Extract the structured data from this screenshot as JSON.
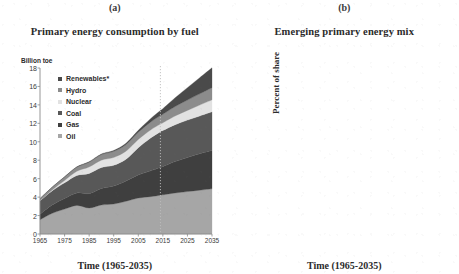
{
  "figure": {
    "panels": [
      {
        "letter": "(a)",
        "title": "Primary energy consumption by fuel",
        "y_unit": "Billion toe",
        "xlabel": "Time (1965-2035)"
      },
      {
        "letter": "(b)",
        "title": "Emerging primary energy mix",
        "ylabel": "Percent of share",
        "xlabel": "Time (1965-2035)"
      }
    ]
  },
  "colors": {
    "oil": "#a6a6a6",
    "gas": "#3f3f3f",
    "coal": "#585858",
    "nuclear": "#e2e2e2",
    "hydro": "#8c8c8c",
    "renewables": "#4a4a4a",
    "axis": "#8a8a8a",
    "forecast_line": "#bdbdbd",
    "line_oil": "#a8a8a8",
    "line_coal": "#5d5d5d",
    "line_gas": "#2f2f2f",
    "line_hydro": "#6e6e6e",
    "line_nuclear": "#b5b5b5",
    "line_renewables": "#4a4a4a"
  },
  "chart_data": [
    {
      "type": "area",
      "id": "primary-energy-consumption-by-fuel",
      "title": "Primary energy consumption by fuel",
      "panel": "(a)",
      "xlabel": "Time (1965-2035)",
      "ylabel": "Billion toe",
      "ylim": [
        0,
        18
      ],
      "xlim": [
        1965,
        2035
      ],
      "yticks": [
        "0",
        "2",
        "4",
        "6",
        "8",
        "10",
        "12",
        "14",
        "16",
        "18"
      ],
      "ytick_values": [
        0,
        2,
        4,
        6,
        8,
        10,
        12,
        14,
        16,
        18
      ],
      "xticks": [
        "1965",
        "1975",
        "1985",
        "1995",
        "2005",
        "2015",
        "2025",
        "2035"
      ],
      "xtick_values": [
        1965,
        1975,
        1985,
        1995,
        2005,
        2015,
        2025,
        2035
      ],
      "stacked": true,
      "grid": false,
      "legend_position": "inside-top-left",
      "annotations": [
        {
          "type": "vline",
          "x": 2014,
          "style": "dotted",
          "label": "forecast start"
        }
      ],
      "x": [
        1965,
        1970,
        1975,
        1980,
        1985,
        1990,
        1995,
        2000,
        2005,
        2010,
        2014,
        2015,
        2020,
        2025,
        2030,
        2035
      ],
      "series": [
        {
          "name": "Oil",
          "color": "#a6a6a6",
          "values": [
            1.55,
            2.25,
            2.7,
            3.1,
            2.82,
            3.15,
            3.25,
            3.55,
            3.9,
            4.05,
            4.2,
            4.25,
            4.45,
            4.6,
            4.75,
            4.9
          ]
        },
        {
          "name": "Gas",
          "color": "#3f3f3f",
          "values": [
            0.6,
            0.9,
            1.15,
            1.35,
            1.55,
            1.78,
            1.95,
            2.2,
            2.5,
            2.8,
            3.0,
            3.05,
            3.4,
            3.7,
            3.95,
            4.15
          ]
        },
        {
          "name": "Coal",
          "color": "#585858",
          "values": [
            1.45,
            1.55,
            1.7,
            1.9,
            2.2,
            2.28,
            2.25,
            2.35,
            2.95,
            3.55,
            3.9,
            3.92,
            4.0,
            4.05,
            4.1,
            4.2
          ]
        },
        {
          "name": "Nuclear",
          "color": "#e2e2e2",
          "values": [
            0.02,
            0.08,
            0.25,
            0.45,
            0.7,
            0.8,
            0.85,
            0.88,
            0.9,
            0.88,
            0.82,
            0.84,
            0.95,
            1.05,
            1.18,
            1.3
          ]
        },
        {
          "name": "Hydro",
          "color": "#8c8c8c",
          "values": [
            0.22,
            0.3,
            0.38,
            0.45,
            0.52,
            0.6,
            0.66,
            0.72,
            0.77,
            0.85,
            0.92,
            0.93,
            1.02,
            1.12,
            1.22,
            1.32
          ]
        },
        {
          "name": "Renewables*",
          "color": "#4a4a4a",
          "values": [
            0.0,
            0.01,
            0.02,
            0.03,
            0.05,
            0.07,
            0.1,
            0.14,
            0.22,
            0.38,
            0.55,
            0.6,
            0.95,
            1.35,
            1.75,
            2.15
          ]
        }
      ],
      "legend": [
        "Renewables*",
        "Hydro",
        "Nuclear",
        "Coal",
        "Gas",
        "Oil"
      ]
    },
    {
      "type": "line",
      "id": "emerging-primary-energy-mix",
      "title": "Emerging primary energy mix",
      "panel": "(b)",
      "xlabel": "Time (1965-2035)",
      "ylabel": "Percent of share",
      "ylim": [
        0,
        50
      ],
      "xlim": [
        1965,
        2035
      ],
      "yticks": [
        "0%",
        "10%",
        "20%",
        "30%",
        "40%",
        "50%"
      ],
      "ytick_values": [
        0,
        10,
        20,
        30,
        40,
        50
      ],
      "xticks": [
        "1965",
        "1975",
        "1985",
        "1995",
        "2005",
        "2015",
        "2025",
        "2035"
      ],
      "xtick_values": [
        1965,
        1975,
        1985,
        1995,
        2005,
        2015,
        2025,
        2035
      ],
      "grid": false,
      "legend_position": "inline-labels",
      "annotations": [
        {
          "type": "vline",
          "x": 2014,
          "style": "dotted",
          "label": "forecast start"
        },
        {
          "type": "text",
          "text": "Oil",
          "x": 1974,
          "y": 42
        },
        {
          "type": "text",
          "text": "Coal",
          "x": 1974,
          "y": 31
        },
        {
          "type": "text",
          "text": "Gas",
          "x": 1974,
          "y": 21
        },
        {
          "type": "text",
          "text": "Hydro",
          "x": 1975,
          "y": 8
        },
        {
          "type": "text",
          "text": "Renewables*",
          "x": 2026,
          "y": 10.5
        },
        {
          "type": "text",
          "text": "Nuclear",
          "x": 2029,
          "y": 1.5
        }
      ],
      "x": [
        1965,
        1968,
        1971,
        1973,
        1975,
        1978,
        1980,
        1983,
        1985,
        1988,
        1990,
        1993,
        1995,
        1998,
        2000,
        2003,
        2005,
        2008,
        2010,
        2012,
        2014,
        2016,
        2020,
        2025,
        2030,
        2035
      ],
      "series": [
        {
          "name": "Oil",
          "color": "#a8a8a8",
          "values": [
            39.5,
            43.5,
            47.0,
            48.5,
            46.5,
            47.0,
            44.5,
            41.0,
            39.0,
            38.5,
            38.2,
            38.0,
            37.8,
            37.5,
            37.5,
            36.5,
            35.5,
            34.0,
            33.0,
            32.5,
            32.0,
            31.5,
            30.5,
            29.5,
            28.5,
            27.5
          ],
          "style": "solid"
        },
        {
          "name": "Coal",
          "color": "#5d5d5d",
          "values": [
            37.5,
            34.0,
            31.0,
            29.5,
            27.5,
            26.0,
            26.8,
            26.0,
            27.0,
            27.8,
            27.2,
            26.0,
            25.5,
            25.3,
            25.5,
            27.0,
            28.5,
            29.3,
            29.5,
            29.8,
            29.0,
            27.8,
            26.8,
            26.0,
            25.3,
            25.0
          ],
          "style": "solid"
        },
        {
          "name": "Gas",
          "color": "#2f2f2f",
          "values": [
            15.5,
            17.0,
            18.5,
            19.0,
            19.5,
            20.0,
            20.3,
            20.8,
            21.0,
            21.5,
            21.8,
            22.0,
            22.3,
            23.0,
            23.2,
            23.3,
            23.5,
            23.8,
            24.0,
            24.2,
            24.3,
            24.5,
            24.8,
            25.2,
            25.3,
            25.2
          ],
          "style": "solid"
        },
        {
          "name": "Hydro",
          "color": "#6e6e6e",
          "values": [
            6.0,
            6.0,
            6.0,
            6.0,
            5.9,
            6.0,
            6.1,
            6.3,
            6.2,
            6.2,
            6.3,
            6.2,
            6.3,
            6.3,
            6.2,
            6.1,
            6.2,
            6.3,
            6.4,
            6.6,
            6.7,
            6.8,
            7.0,
            7.0,
            7.0,
            7.0
          ],
          "style": "solid"
        },
        {
          "name": "Nuclear",
          "color": "#b5b5b5",
          "values": [
            0.2,
            0.5,
            1.2,
            1.8,
            2.5,
            3.5,
            4.2,
            5.2,
            5.8,
            6.2,
            6.3,
            6.3,
            6.3,
            6.3,
            6.3,
            6.2,
            6.1,
            5.8,
            5.5,
            5.0,
            4.8,
            4.9,
            5.1,
            5.4,
            5.7,
            6.0
          ],
          "style": "solid"
        },
        {
          "name": "Renewables*",
          "color": "#4a4a4a",
          "values": [
            0.0,
            0.0,
            0.0,
            0.1,
            0.1,
            0.1,
            0.2,
            0.2,
            0.3,
            0.3,
            0.4,
            0.5,
            0.6,
            0.7,
            0.8,
            1.0,
            1.2,
            1.6,
            2.0,
            2.6,
            3.2,
            3.9,
            5.5,
            7.2,
            8.8,
            10.2
          ],
          "style": "solid"
        }
      ]
    }
  ]
}
